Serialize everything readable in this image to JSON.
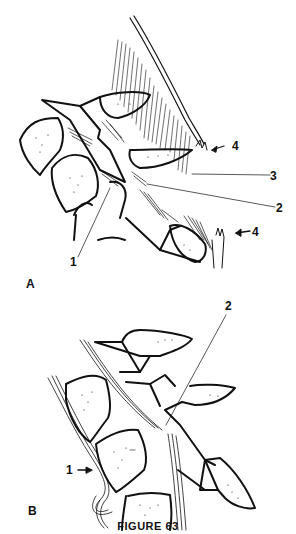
{
  "figure": {
    "caption": "FIGURE 63",
    "panels": [
      {
        "id": "A",
        "label": "A",
        "callouts": [
          {
            "label": "1"
          },
          {
            "label": "2"
          },
          {
            "label": "3"
          },
          {
            "label": "4"
          },
          {
            "label": "4"
          }
        ]
      },
      {
        "id": "B",
        "label": "B",
        "callouts": [
          {
            "label": "1"
          },
          {
            "label": "2"
          }
        ]
      }
    ],
    "colors": {
      "ink": "#111111",
      "background": "#ffffff"
    }
  }
}
